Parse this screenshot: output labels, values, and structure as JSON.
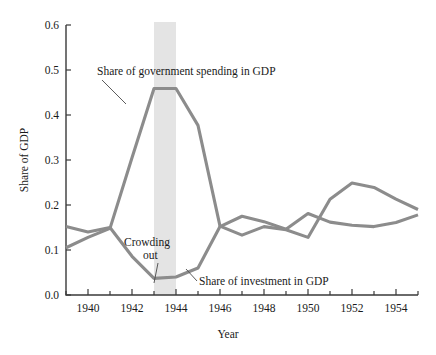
{
  "chart_data": {
    "type": "line",
    "title": "",
    "xlabel": "Year",
    "ylabel": "Share of GDP",
    "xlim": [
      1939,
      1955
    ],
    "ylim": [
      0.0,
      0.6
    ],
    "grid": false,
    "legend": "none",
    "y_ticks": [
      "0.0",
      "0.1",
      "0.2",
      "0.3",
      "0.4",
      "0.5",
      "0.6"
    ],
    "y_tick_values": [
      0.0,
      0.1,
      0.2,
      0.3,
      0.4,
      0.5,
      0.6
    ],
    "x_ticks_major": [
      "1940",
      "1942",
      "1944",
      "1946",
      "1948",
      "1950",
      "1952",
      "1954"
    ],
    "x_tick_values_major": [
      1940,
      1942,
      1944,
      1946,
      1948,
      1950,
      1952,
      1954
    ],
    "x_tick_values_all": [
      1939,
      1940,
      1941,
      1942,
      1943,
      1944,
      1945,
      1946,
      1947,
      1948,
      1949,
      1950,
      1951,
      1952,
      1953,
      1954,
      1955
    ],
    "x": [
      1939,
      1940,
      1941,
      1942,
      1943,
      1944,
      1945,
      1946,
      1947,
      1948,
      1949,
      1950,
      1951,
      1952,
      1953,
      1954,
      1955
    ],
    "series": [
      {
        "name": "Share of government spending in GDP",
        "color": "#8c8c8c",
        "values": [
          0.105,
          0.128,
          0.148,
          0.305,
          0.459,
          0.459,
          0.377,
          0.153,
          0.133,
          0.152,
          0.145,
          0.128,
          0.213,
          0.249,
          0.239,
          0.213,
          0.19
        ]
      },
      {
        "name": "Share of investment in GDP",
        "color": "#8c8c8c",
        "values": [
          0.152,
          0.14,
          0.15,
          0.086,
          0.037,
          0.04,
          0.06,
          0.152,
          0.175,
          0.163,
          0.146,
          0.181,
          0.162,
          0.155,
          0.152,
          0.161,
          0.178
        ]
      }
    ],
    "shaded_band": {
      "label": "Crowding out",
      "x_start": 1943,
      "x_end": 1944,
      "color": "#e4e4e4"
    },
    "annotations": [
      {
        "text": "Share of government spending in GDP",
        "x": 1941.8,
        "y": 0.505
      },
      {
        "text": "Crowding out",
        "x": 1942.6,
        "y": 0.108
      },
      {
        "text": "out",
        "x": 1943.0,
        "y": 0.082
      },
      {
        "text": "Share of investment in GDP",
        "x": 1945.5,
        "y": 0.04
      }
    ]
  },
  "annotation_text": {
    "government": "Share of government spending in GDP",
    "crowding_line1": "Crowding",
    "crowding_line2": "out",
    "investment": "Share of investment in GDP"
  },
  "axes": {
    "x_title": "Year",
    "y_title": "Share of GDP"
  }
}
